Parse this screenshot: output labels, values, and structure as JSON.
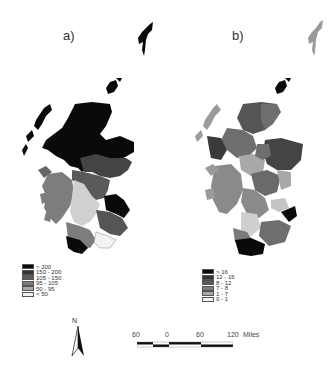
{
  "panels": [
    {
      "label": "a)",
      "legend": {
        "items": [
          {
            "label": "> 200",
            "color": "#0a0a0a"
          },
          {
            "label": "150 - 200",
            "color": "#333333"
          },
          {
            "label": "105 - 150",
            "color": "#5a5a5a"
          },
          {
            "label": "95 - 105",
            "color": "#7d7d7d"
          },
          {
            "label": "50 - 95",
            "color": "#a8a8a8"
          },
          {
            "label": "< 50",
            "color": "#f2f2f2"
          }
        ]
      }
    },
    {
      "label": "b)",
      "legend": {
        "items": [
          {
            "label": "> 16",
            "color": "#0a0a0a"
          },
          {
            "label": "12 - 16",
            "color": "#333333"
          },
          {
            "label": "8 - 12",
            "color": "#5a5a5a"
          },
          {
            "label": "7 - 8",
            "color": "#7d7d7d"
          },
          {
            "label": "1 - 7",
            "color": "#a8a8a8"
          },
          {
            "label": "0 - 1",
            "color": "#f2f2f2"
          }
        ]
      }
    }
  ],
  "north_arrow": {
    "label": "N"
  },
  "scale": {
    "ticks": [
      "60",
      "0",
      "60",
      "120"
    ],
    "unit": "Miles"
  },
  "colors": {
    "map_a_dominant": "#111111",
    "map_b_dominant": "#6e6e6e"
  }
}
